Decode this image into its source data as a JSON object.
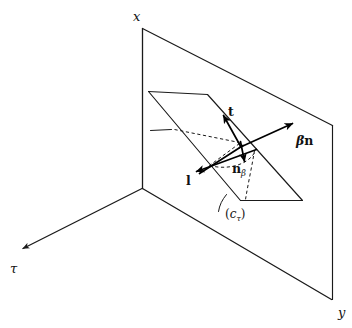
{
  "figure": {
    "background_color": "#ffffff",
    "line_color": "#1a1a1a"
  },
  "axes": [
    {
      "id": "x-axis",
      "label": "x",
      "direction": "vertical-up",
      "label_x": 133,
      "label_y": 10
    },
    {
      "id": "tau-axis",
      "label": "τ",
      "direction": "down-left",
      "arrowhead": true,
      "label_x": 10,
      "label_y": 262
    },
    {
      "id": "y-axis",
      "label": "y",
      "direction": "down-right",
      "label_x": 338,
      "label_y": 306
    }
  ],
  "vectors": [
    {
      "id": "t-vector",
      "label": "t",
      "label_x": 228,
      "label_y": 106,
      "description": "tangent vector pointing up-right",
      "from": [
        240,
        143
      ],
      "to": [
        223,
        115
      ]
    },
    {
      "id": "beta-n-vector",
      "label": "βn",
      "greek": "β",
      "bold": "n",
      "label_x": 296,
      "label_y": 135,
      "description": "beta times normal vector pointing up-right",
      "from": [
        240,
        143
      ],
      "to": [
        292,
        124
      ]
    },
    {
      "id": "n-beta-vector",
      "label": "nβ",
      "bold": "n",
      "subscript": "β",
      "label_x": 232,
      "label_y": 163,
      "description": "normal vector n subscript beta pointing down",
      "from": [
        240,
        143
      ],
      "to": [
        245,
        163
      ]
    },
    {
      "id": "l-vector",
      "label": "l",
      "label_x": 186,
      "label_y": 175,
      "description": "vector l pointing down-left",
      "from": [
        253,
        150
      ],
      "to": [
        196,
        172
      ]
    }
  ],
  "annotations": [
    {
      "id": "c-tau-label",
      "text": "(cτ)",
      "base": "c",
      "subscript": "τ",
      "label_x": 228,
      "label_y": 213,
      "description": "curve label c sub tau with leader line"
    }
  ],
  "surfaces": [
    {
      "id": "vertical-plane",
      "description": "vertical x-y coordinate plane quadrilateral"
    },
    {
      "id": "inclined-plane",
      "description": "inclined parallelogram surface cutting through the vertical plane"
    }
  ]
}
